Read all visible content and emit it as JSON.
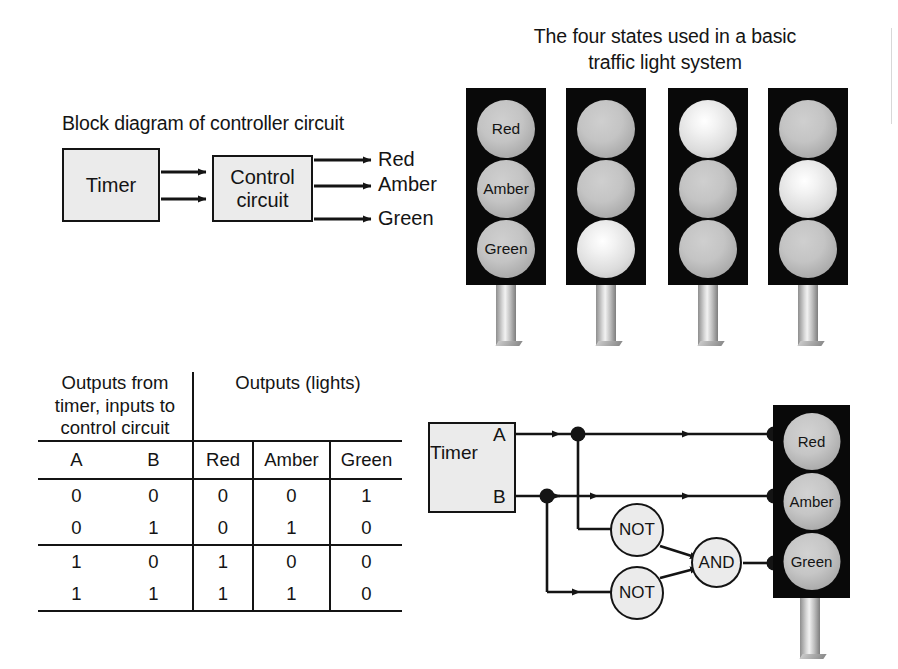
{
  "block_diagram": {
    "caption": "Block diagram of controller circuit",
    "timer_label": "Timer",
    "control_label_line1": "Control",
    "control_label_line2": "circuit",
    "outputs": [
      "Red",
      "Amber",
      "Green"
    ]
  },
  "states_figure": {
    "caption_line1": "The four states used in a basic",
    "caption_line2": "traffic light system",
    "bulb_labels": [
      "Red",
      "Amber",
      "Green"
    ],
    "states": [
      {
        "name": "state-1-green",
        "red": "off",
        "amber": "off",
        "green": "off",
        "labelled": true
      },
      {
        "name": "state-2-green",
        "red": "off",
        "amber": "off",
        "green": "on",
        "labelled": false
      },
      {
        "name": "state-3-red",
        "red": "on",
        "amber": "off",
        "green": "off",
        "labelled": false
      },
      {
        "name": "state-4-red-amber",
        "red": "off",
        "amber": "on",
        "green": "off",
        "labelled": false
      }
    ]
  },
  "truth_table": {
    "group_header_left": "Outputs from timer, inputs to control circuit",
    "group_header_right": "Outputs (lights)",
    "columns": [
      "A",
      "B",
      "Red",
      "Amber",
      "Green"
    ],
    "rows": [
      [
        "0",
        "0",
        "0",
        "0",
        "1"
      ],
      [
        "0",
        "1",
        "0",
        "1",
        "0"
      ],
      [
        "1",
        "0",
        "1",
        "0",
        "0"
      ],
      [
        "1",
        "1",
        "1",
        "1",
        "0"
      ]
    ]
  },
  "logic_circuit": {
    "timer_label": "Timer",
    "pin_a": "A",
    "pin_b": "B",
    "gate_not_1": "NOT",
    "gate_not_2": "NOT",
    "gate_and": "AND",
    "bulb_red": "Red",
    "bulb_amber": "Amber",
    "bulb_green": "Green"
  },
  "colors": {
    "ink": "#141414",
    "box_fill": "#ebebeb",
    "housing": "#090909",
    "bulb_off": "#c4c4c4",
    "bulb_on": "#f2f2f2",
    "page": "#ffffff"
  }
}
